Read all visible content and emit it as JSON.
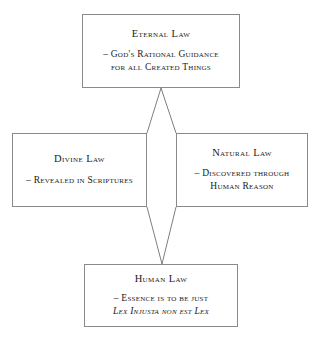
{
  "diagram": {
    "type": "hierarchy-diagram",
    "background_color": "#ffffff",
    "border_color": "#8a8a8a",
    "text_color": "#1a1a1a",
    "nodes": [
      {
        "id": "eternal",
        "title": "Eternal Law",
        "lines": [
          "– God's Rational Guidance",
          "for all Created Things"
        ]
      },
      {
        "id": "divine",
        "title": "Divine Law",
        "lines": [
          "– Revealed in Scriptures"
        ]
      },
      {
        "id": "natural",
        "title": "Natural Law",
        "lines": [
          "– Discovered through",
          "Human Reason"
        ]
      },
      {
        "id": "human",
        "title": "Human Law",
        "lines": [
          "– Essence is to be just",
          "Lex Injusta non est Lex"
        ]
      }
    ],
    "connections": [
      {
        "from": "eternal",
        "to": "divine"
      },
      {
        "from": "eternal",
        "to": "natural"
      },
      {
        "from": "divine",
        "to": "human"
      },
      {
        "from": "natural",
        "to": "human"
      }
    ]
  }
}
